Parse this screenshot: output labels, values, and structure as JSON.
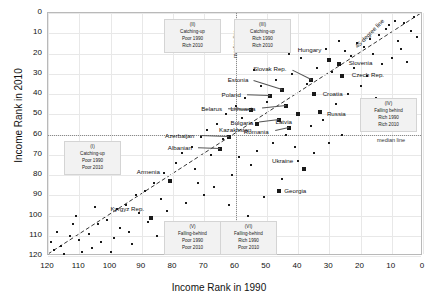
{
  "chart_data": {
    "type": "scatter",
    "title": "",
    "xlabel": "Income Rank in 1990",
    "ylabel": "Income Rank in 2010",
    "xlim": [
      120,
      0
    ],
    "ylim": [
      120,
      0
    ],
    "x_reversed": true,
    "y_reversed": true,
    "xticks": [
      120,
      110,
      100,
      90,
      80,
      70,
      60,
      50,
      40,
      30,
      20,
      10,
      0
    ],
    "yticks": [
      0,
      10,
      20,
      30,
      40,
      50,
      60,
      70,
      80,
      90,
      100,
      110,
      120
    ],
    "grid": true,
    "legend": "none",
    "reference_lines": [
      {
        "name": "45-degree line",
        "label": "45-degree line",
        "type": "diagonal"
      },
      {
        "name": "median-line-vertical",
        "label": "median line",
        "value": 60,
        "axis": "x"
      },
      {
        "name": "median-line-horizontal",
        "label": "median line",
        "value": 60,
        "axis": "y"
      }
    ],
    "labeled_points": [
      {
        "name": "Slovenia",
        "x": 27,
        "y": 25,
        "label_dx": 10,
        "label_dy": -1
      },
      {
        "name": "Czech Rep.",
        "x": 26,
        "y": 31,
        "label_dx": 10,
        "label_dy": -1
      },
      {
        "name": "Hungary",
        "x": 30,
        "y": 23,
        "label_dx": -6,
        "label_dy": -10
      },
      {
        "name": "Slovak Rep.",
        "x": 36,
        "y": 33,
        "label_dx": -22,
        "label_dy": -11
      },
      {
        "name": "Croatia",
        "x": 35,
        "y": 40,
        "label_dx": 9,
        "label_dy": 0
      },
      {
        "name": "Estonia",
        "x": 45,
        "y": 38,
        "label_dx": -32,
        "label_dy": -10
      },
      {
        "name": "Poland",
        "x": 49,
        "y": 41,
        "label_dx": -27,
        "label_dy": -1
      },
      {
        "name": "Lithuania",
        "x": 44,
        "y": 46,
        "label_dx": -28,
        "label_dy": 3
      },
      {
        "name": "Russia",
        "x": 33,
        "y": 49,
        "label_dx": 7,
        "label_dy": 2
      },
      {
        "name": "Latvia",
        "x": 40,
        "y": 50,
        "label_dx": -4,
        "label_dy": 8
      },
      {
        "name": "Belarus",
        "x": 55,
        "y": 48,
        "label_dx": -27,
        "label_dy": -1
      },
      {
        "name": "Bulgaria",
        "x": 46,
        "y": 53,
        "label_dx": -24,
        "label_dy": 3
      },
      {
        "name": "Kazakhstan",
        "x": 53,
        "y": 55,
        "label_dx": -4,
        "label_dy": 6
      },
      {
        "name": "Romania",
        "x": 43,
        "y": 57,
        "label_dx": -18,
        "label_dy": 4
      },
      {
        "name": "Azerbaijan",
        "x": 62,
        "y": 61,
        "label_dx": -33,
        "label_dy": -1
      },
      {
        "name": "Albanian",
        "x": 65,
        "y": 67,
        "label_dx": -26,
        "label_dy": -1
      },
      {
        "name": "Armenia",
        "x": 81,
        "y": 83,
        "label_dx": -8,
        "label_dy": -9
      },
      {
        "name": "Ukraine",
        "x": 38,
        "y": 77,
        "label_dx": -9,
        "label_dy": -8
      },
      {
        "name": "Georgia",
        "x": 46,
        "y": 88,
        "label_dx": 5,
        "label_dy": 0
      },
      {
        "name": "Kyrgyz Rep.",
        "x": 87,
        "y": 101,
        "label_dx": -5,
        "label_dy": -9
      },
      {
        "name": "Tajikistan",
        "x": 80,
        "y": 105,
        "label_dx": 5,
        "label_dy": 0
      }
    ],
    "unlabeled_points": [
      {
        "x": 3,
        "y": 2
      },
      {
        "x": 6,
        "y": 5
      },
      {
        "x": 9,
        "y": 4
      },
      {
        "x": 12,
        "y": 8
      },
      {
        "x": 14,
        "y": 11
      },
      {
        "x": 8,
        "y": 14
      },
      {
        "x": 17,
        "y": 13
      },
      {
        "x": 19,
        "y": 17
      },
      {
        "x": 21,
        "y": 15
      },
      {
        "x": 16,
        "y": 20
      },
      {
        "x": 23,
        "y": 21
      },
      {
        "x": 11,
        "y": 6
      },
      {
        "x": 25,
        "y": 19
      },
      {
        "x": 4,
        "y": 9
      },
      {
        "x": 27,
        "y": 14
      },
      {
        "x": 22,
        "y": 27
      },
      {
        "x": 31,
        "y": 18
      },
      {
        "x": 29,
        "y": 29
      },
      {
        "x": 34,
        "y": 27
      },
      {
        "x": 39,
        "y": 22
      },
      {
        "x": 42,
        "y": 30
      },
      {
        "x": 37,
        "y": 35
      },
      {
        "x": 47,
        "y": 33
      },
      {
        "x": 52,
        "y": 36
      },
      {
        "x": 50,
        "y": 44
      },
      {
        "x": 57,
        "y": 42
      },
      {
        "x": 60,
        "y": 46
      },
      {
        "x": 58,
        "y": 52
      },
      {
        "x": 63,
        "y": 50
      },
      {
        "x": 66,
        "y": 55
      },
      {
        "x": 69,
        "y": 58
      },
      {
        "x": 64,
        "y": 62
      },
      {
        "x": 71,
        "y": 61
      },
      {
        "x": 74,
        "y": 66
      },
      {
        "x": 68,
        "y": 70
      },
      {
        "x": 77,
        "y": 69
      },
      {
        "x": 79,
        "y": 74
      },
      {
        "x": 73,
        "y": 77
      },
      {
        "x": 83,
        "y": 79
      },
      {
        "x": 86,
        "y": 84
      },
      {
        "x": 89,
        "y": 88
      },
      {
        "x": 84,
        "y": 92
      },
      {
        "x": 92,
        "y": 90
      },
      {
        "x": 95,
        "y": 95
      },
      {
        "x": 91,
        "y": 99
      },
      {
        "x": 98,
        "y": 97
      },
      {
        "x": 101,
        "y": 102
      },
      {
        "x": 97,
        "y": 106
      },
      {
        "x": 104,
        "y": 104
      },
      {
        "x": 107,
        "y": 109
      },
      {
        "x": 110,
        "y": 112
      },
      {
        "x": 113,
        "y": 110
      },
      {
        "x": 116,
        "y": 115
      },
      {
        "x": 118,
        "y": 117
      },
      {
        "x": 115,
        "y": 119
      },
      {
        "x": 109,
        "y": 118
      },
      {
        "x": 103,
        "y": 113
      },
      {
        "x": 106,
        "y": 116
      },
      {
        "x": 99,
        "y": 111
      },
      {
        "x": 94,
        "y": 108
      },
      {
        "x": 88,
        "y": 103
      },
      {
        "x": 82,
        "y": 98
      },
      {
        "x": 76,
        "y": 94
      },
      {
        "x": 70,
        "y": 90
      },
      {
        "x": 72,
        "y": 84
      },
      {
        "x": 67,
        "y": 86
      },
      {
        "x": 61,
        "y": 80
      },
      {
        "x": 55,
        "y": 75
      },
      {
        "x": 59,
        "y": 71
      },
      {
        "x": 53,
        "y": 68
      },
      {
        "x": 48,
        "y": 64
      },
      {
        "x": 44,
        "y": 60
      },
      {
        "x": 41,
        "y": 66
      },
      {
        "x": 36,
        "y": 56
      },
      {
        "x": 32,
        "y": 53
      },
      {
        "x": 28,
        "y": 45
      },
      {
        "x": 24,
        "y": 40
      },
      {
        "x": 20,
        "y": 36
      },
      {
        "x": 18,
        "y": 31
      },
      {
        "x": 13,
        "y": 25
      },
      {
        "x": 10,
        "y": 22
      },
      {
        "x": 7,
        "y": 18
      },
      {
        "x": 5,
        "y": 24
      },
      {
        "x": 15,
        "y": 42
      },
      {
        "x": 2,
        "y": 12
      },
      {
        "x": 26,
        "y": 60
      },
      {
        "x": 30,
        "y": 64
      },
      {
        "x": 112,
        "y": 104
      },
      {
        "x": 100,
        "y": 118
      },
      {
        "x": 93,
        "y": 114
      },
      {
        "x": 85,
        "y": 110
      },
      {
        "x": 78,
        "y": 112
      },
      {
        "x": 62,
        "y": 95
      },
      {
        "x": 56,
        "y": 100
      },
      {
        "x": 51,
        "y": 91
      },
      {
        "x": 45,
        "y": 82
      },
      {
        "x": 40,
        "y": 73
      },
      {
        "x": 35,
        "y": 69
      },
      {
        "x": 54,
        "y": 28
      },
      {
        "x": 43,
        "y": 20
      },
      {
        "x": 119,
        "y": 113
      },
      {
        "x": 117,
        "y": 108
      },
      {
        "x": 111,
        "y": 100
      },
      {
        "x": 105,
        "y": 96
      }
    ],
    "quadrants": [
      {
        "id": "I",
        "roman": "(I)",
        "title": "Catching-up",
        "line1": "Poor 1990",
        "line2": "Poor 2010"
      },
      {
        "id": "II",
        "roman": "(II)",
        "title": "Catching-up",
        "line1": "Poor 1990",
        "line2": "Rich 2010"
      },
      {
        "id": "III",
        "roman": "(III)",
        "title": "Catching-up",
        "line1": "Rich 1990",
        "line2": "Rich 2010"
      },
      {
        "id": "IV",
        "roman": "(IV)",
        "title": "Falling behind",
        "line1": "Rich 1990",
        "line2": "Rich 2010"
      },
      {
        "id": "V",
        "roman": "(V)",
        "title": "Falling-behind",
        "line1": "Poor 1990",
        "line2": "Poor 2010"
      },
      {
        "id": "VI",
        "roman": "(VI)",
        "title": "Falling-behind",
        "line1": "Rich 1990",
        "line2": "Poor 2010"
      }
    ]
  }
}
